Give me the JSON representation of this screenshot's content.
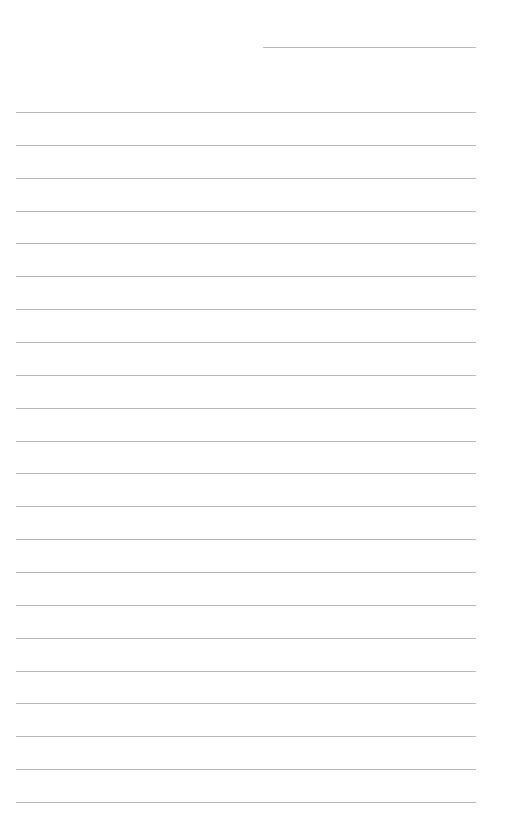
{
  "page": {
    "type": "lined-paper",
    "background": "#ffffff",
    "line_color": "#b8b8b8",
    "header_line": {
      "x": 263,
      "y": 47,
      "width": 213
    },
    "ruled_lines": {
      "count": 22,
      "start_y": 112,
      "spacing": 32.86,
      "x": 16,
      "width": 460
    }
  }
}
